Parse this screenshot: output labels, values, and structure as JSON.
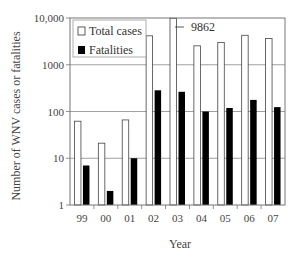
{
  "chart_data": {
    "type": "bar",
    "title": "",
    "xlabel": "Year",
    "ylabel": "Number of WNV cases or fatalities",
    "yscale": "log",
    "ylim": [
      1,
      10000
    ],
    "ytick_labels": [
      "1",
      "10",
      "100",
      "1000",
      "10,000"
    ],
    "ytick_values": [
      1,
      10,
      100,
      1000,
      10000
    ],
    "grid": "horizontal",
    "legend_position": "upper-left",
    "categories": [
      "99",
      "00",
      "01",
      "02",
      "03",
      "04",
      "05",
      "06",
      "07"
    ],
    "series": [
      {
        "name": "Total cases",
        "fill": "#ffffff",
        "values": [
          62,
          21,
          66,
          4156,
          9862,
          2539,
          3000,
          4269,
          3630
        ]
      },
      {
        "name": "Fatalities",
        "fill": "#000000",
        "values": [
          7,
          2,
          10,
          284,
          264,
          100,
          119,
          177,
          124
        ]
      }
    ],
    "annotations": [
      {
        "category": "03",
        "series": "Total cases",
        "text": "9862"
      }
    ]
  },
  "labels": {
    "xlabel": "Year",
    "ylabel": "Number of WNV cases or fatalities",
    "legend_total": "Total cases",
    "legend_fatalities": "Fatalities",
    "annotation": "9862"
  }
}
